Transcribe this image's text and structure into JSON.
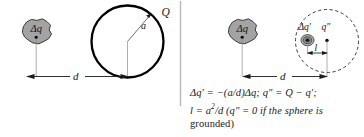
{
  "figure": {
    "background_color": "#ffffff",
    "width": 364,
    "height": 137,
    "divider": {
      "name": "panel-divider",
      "color": "#b6b6b6"
    }
  },
  "left_panel": {
    "name": "physical-configuration-panel",
    "blob": {
      "label": "Δq",
      "fill_color": "#a3a3a3",
      "stroke_color": "#2b2b2b",
      "point_color": "#000000"
    },
    "sphere": {
      "label_charge": "Q",
      "label_radius": "a",
      "stroke_color": "#000000",
      "fill_color": "#ffffff",
      "style": "solid"
    },
    "dimension": {
      "label": "d",
      "color": "#1a1a1a"
    }
  },
  "right_panel": {
    "name": "image-charge-configuration-panel",
    "blob": {
      "label": "Δq",
      "fill_color": "#a3a3a3",
      "stroke_color": "#2b2b2b",
      "point_color": "#000000"
    },
    "sphere": {
      "stroke_color": "#3a3a3a",
      "fill_color": "#ffffff",
      "style": "dashed"
    },
    "image_charge": {
      "label": "Δq′",
      "fill_color": "#9a9a9a",
      "core_color": "#1c1c1c"
    },
    "center_charge": {
      "label": "q″",
      "point_color": "#000000"
    },
    "dimension_l": {
      "label": "l",
      "color": "#1a1a1a"
    },
    "dimension_d": {
      "label": "d",
      "color": "#1a1a1a"
    }
  },
  "equations": {
    "name": "equation-caption",
    "line1_parts": {
      "a": "Δq′ = −(a/d)Δq; ",
      "b": "q″ = Q − q′;"
    },
    "line2_parts": {
      "a": "l = a",
      "exp": "2",
      "b": "/d  (q″ = 0 if the sphere is"
    },
    "line3": "grounded)",
    "plain_text": "Δq′ = −(a/d)Δq; q″ = Q − q′; l = a²/d (q″ = 0 if the sphere is grounded)"
  }
}
